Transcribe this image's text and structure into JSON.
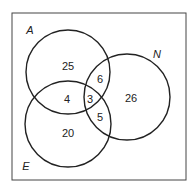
{
  "diagram": {
    "type": "venn",
    "sets": [
      {
        "name": "A",
        "cx": 68,
        "cy": 72,
        "r": 42,
        "label_x": 30,
        "label_y": 34
      },
      {
        "name": "N",
        "cx": 127,
        "cy": 97,
        "r": 43,
        "label_x": 157,
        "label_y": 58
      },
      {
        "name": "E",
        "cx": 68,
        "cy": 124,
        "r": 43,
        "label_x": 26,
        "label_y": 170
      }
    ],
    "regions": [
      {
        "id": "A_only",
        "value": "25",
        "x": 68,
        "y": 70
      },
      {
        "id": "N_only",
        "value": "26",
        "x": 131,
        "y": 102
      },
      {
        "id": "E_only",
        "value": "20",
        "x": 68,
        "y": 137
      },
      {
        "id": "A_N_only",
        "value": "6",
        "x": 100,
        "y": 83
      },
      {
        "id": "A_E_only",
        "value": "4",
        "x": 67,
        "y": 103
      },
      {
        "id": "N_E_only",
        "value": "5",
        "x": 100,
        "y": 121
      },
      {
        "id": "A_N_E",
        "value": "3",
        "x": 90,
        "y": 103
      }
    ],
    "colors": {
      "stroke": "#222222",
      "box": "#444444",
      "background": "#ffffff"
    }
  }
}
